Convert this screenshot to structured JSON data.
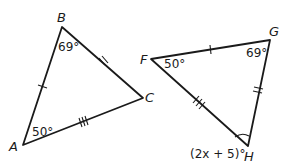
{
  "diagram": {
    "type": "congruent-triangles",
    "triangles": [
      {
        "name": "triangle-ABC",
        "vertices": {
          "A": {
            "label": "A",
            "x": 23,
            "y": 145
          },
          "B": {
            "label": "B",
            "x": 62,
            "y": 27
          },
          "C": {
            "label": "C",
            "x": 143,
            "y": 98
          }
        },
        "angles": {
          "B": "69°",
          "A": "50°"
        },
        "side_ticks": {
          "AB": 1,
          "BC": 2,
          "AC": 3
        }
      },
      {
        "name": "triangle-FGH",
        "vertices": {
          "F": {
            "label": "F",
            "x": 151,
            "y": 59
          },
          "G": {
            "label": "G",
            "x": 270,
            "y": 40
          },
          "H": {
            "label": "H",
            "x": 248,
            "y": 146
          }
        },
        "angles": {
          "F": "50°",
          "G": "69°",
          "H": "(2x + 5)°"
        },
        "side_ticks": {
          "FG": 1,
          "GH": 2,
          "FH": 3
        }
      }
    ]
  }
}
